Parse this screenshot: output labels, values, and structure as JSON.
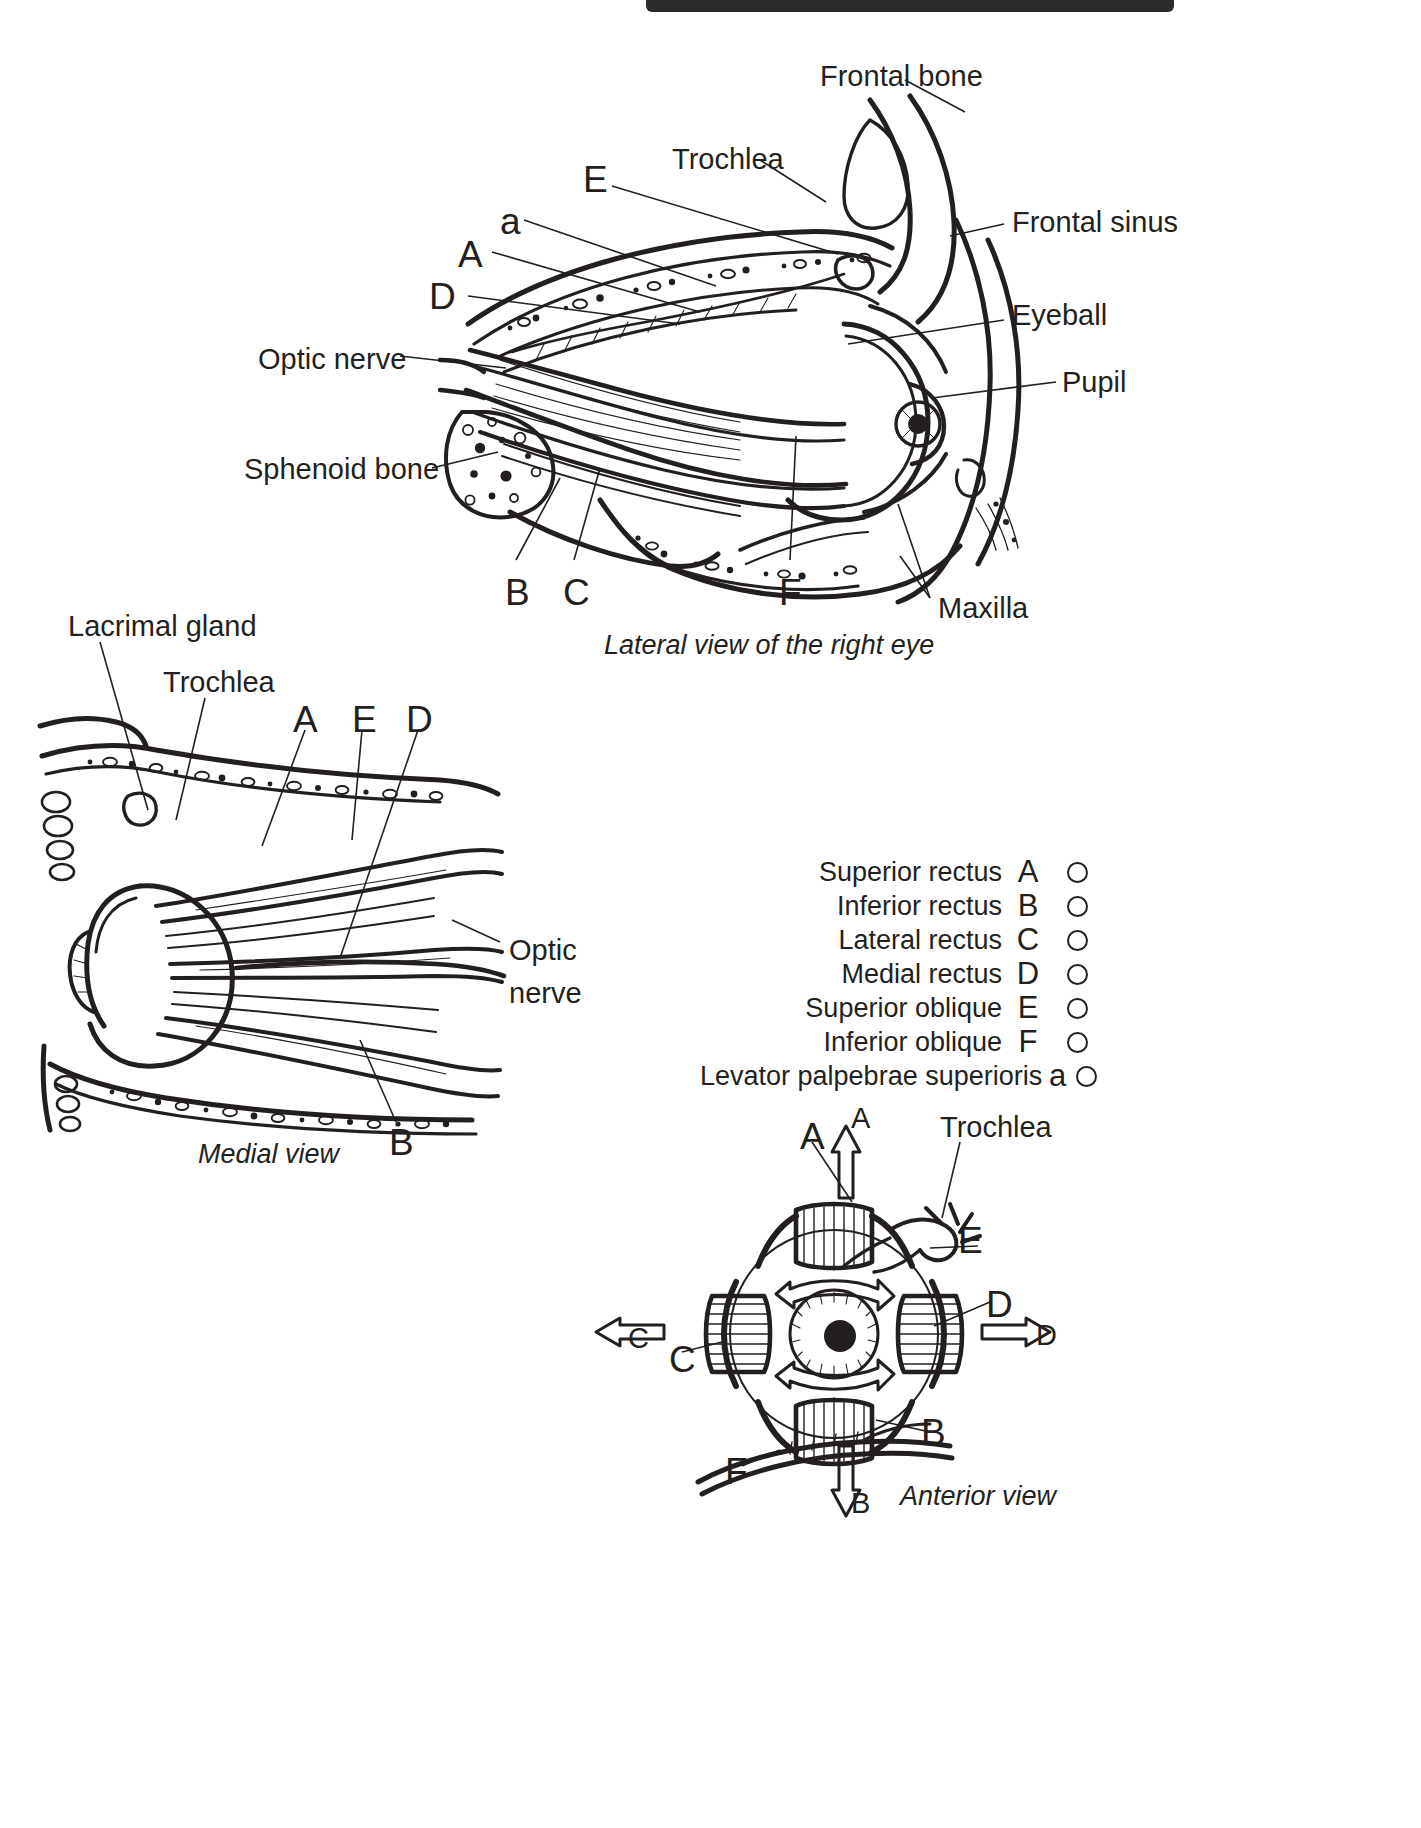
{
  "page": {
    "background": "#ffffff",
    "ink": "#231f20",
    "header_bar_color": "#2b2b2b"
  },
  "figures": {
    "lateral": {
      "caption": "Lateral view of the right eye",
      "labels": [
        {
          "text": "Frontal bone",
          "x": 820,
          "y": 62
        },
        {
          "text": "Trochlea",
          "x": 672,
          "y": 145
        },
        {
          "text": "E",
          "x": 583,
          "y": 166
        },
        {
          "text": "a",
          "x": 500,
          "y": 207
        },
        {
          "text": "A",
          "x": 458,
          "y": 240
        },
        {
          "text": "D",
          "x": 429,
          "y": 282
        },
        {
          "text": "Frontal sinus",
          "x": 1012,
          "y": 212
        },
        {
          "text": "Eyeball",
          "x": 1012,
          "y": 305
        },
        {
          "text": "Pupil",
          "x": 1062,
          "y": 372
        },
        {
          "text": "Optic nerve",
          "x": 258,
          "y": 349
        },
        {
          "text": "Sphenoid bone",
          "x": 244,
          "y": 459
        },
        {
          "text": "B",
          "x": 505,
          "y": 578
        },
        {
          "text": "C",
          "x": 563,
          "y": 578
        },
        {
          "text": "F",
          "x": 779,
          "y": 578
        },
        {
          "text": "Maxilla",
          "x": 938,
          "y": 598
        }
      ]
    },
    "medial": {
      "caption": "Medial view",
      "labels": [
        {
          "text": "Lacrimal gland",
          "x": 68,
          "y": 612
        },
        {
          "text": "Trochlea",
          "x": 163,
          "y": 668
        },
        {
          "text": "A",
          "x": 293,
          "y": 705
        },
        {
          "text": "E",
          "x": 352,
          "y": 705
        },
        {
          "text": "D",
          "x": 406,
          "y": 705
        },
        {
          "text": "Optic",
          "x": 509,
          "y": 940
        },
        {
          "text": "nerve",
          "x": 509,
          "y": 983
        },
        {
          "text": "B",
          "x": 389,
          "y": 1128
        }
      ]
    },
    "anterior": {
      "caption": "Anterior view",
      "labels": [
        {
          "text": "A",
          "x": 803,
          "y": 1122
        },
        {
          "text": "A",
          "x": 852,
          "y": 1109
        },
        {
          "text": "Trochlea",
          "x": 940,
          "y": 1117
        },
        {
          "text": "E",
          "x": 960,
          "y": 1227
        },
        {
          "text": "D",
          "x": 988,
          "y": 1290
        },
        {
          "text": "D",
          "x": 1038,
          "y": 1324
        },
        {
          "text": "C",
          "x": 630,
          "y": 1327
        },
        {
          "text": "C",
          "x": 671,
          "y": 1345
        },
        {
          "text": "B",
          "x": 923,
          "y": 1418
        },
        {
          "text": "B",
          "x": 852,
          "y": 1492
        },
        {
          "text": "F",
          "x": 727,
          "y": 1457
        }
      ]
    }
  },
  "legend": {
    "rows": [
      {
        "name": "Superior rectus",
        "letter": "A",
        "marker": "circle"
      },
      {
        "name": "Inferior rectus",
        "letter": "B",
        "marker": "circle"
      },
      {
        "name": "Lateral rectus",
        "letter": "C",
        "marker": "circle"
      },
      {
        "name": "Medial rectus",
        "letter": "D",
        "marker": "circle"
      },
      {
        "name": "Superior oblique",
        "letter": "E",
        "marker": "circle"
      },
      {
        "name": "Inferior oblique",
        "letter": "F",
        "marker": "circle"
      },
      {
        "name": "Levator palpebrae superioris",
        "letter": "a",
        "marker": "circle"
      }
    ]
  }
}
